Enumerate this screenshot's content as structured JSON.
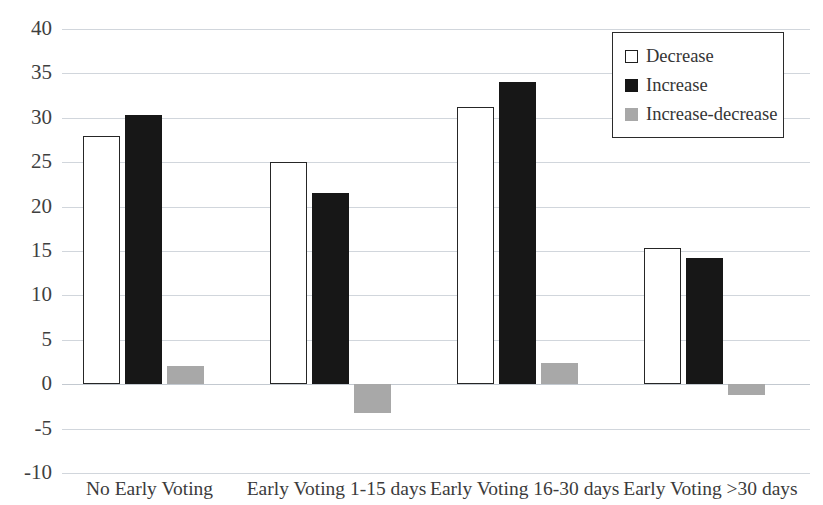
{
  "chart_data": {
    "type": "bar",
    "title": "",
    "subtitle": "",
    "xlabel": "",
    "ylabel": "",
    "ylim": [
      -10,
      40
    ],
    "ytick_step": 5,
    "yticks": [
      "40",
      "35",
      "30",
      "25",
      "20",
      "15",
      "10",
      "5",
      "0",
      "-5",
      "-10"
    ],
    "ytick_values": [
      40,
      35,
      30,
      25,
      20,
      15,
      10,
      5,
      0,
      -5,
      -10
    ],
    "grid": true,
    "grid_axis": "y",
    "legend_position": "top-right",
    "categories": [
      "No Early Voting",
      "Early Voting 1-15 days",
      "Early Voting 16-30 days",
      "Early Voting >30 days"
    ],
    "series": [
      {
        "name": "Decrease",
        "color": "#ffffff",
        "edge_color": "#262626",
        "values": [
          28.0,
          25.0,
          31.2,
          15.3
        ]
      },
      {
        "name": "Increase",
        "color": "#171717",
        "edge_color": "#171717",
        "values": [
          30.3,
          21.5,
          34.0,
          14.2
        ]
      },
      {
        "name": "Increase-decrease",
        "color": "#a8a8a8",
        "edge_color": "#a8a8a8",
        "values": [
          2.0,
          -3.2,
          2.4,
          -1.2
        ]
      }
    ]
  },
  "legend": {
    "items": [
      {
        "label": "Decrease",
        "swatch": "white-square-icon"
      },
      {
        "label": "Increase",
        "swatch": "black-square-icon"
      },
      {
        "label": "Increase-decrease",
        "swatch": "gray-square-icon"
      }
    ]
  },
  "axis": {
    "y_labels": [
      "40",
      "35",
      "30",
      "25",
      "20",
      "15",
      "10",
      "5",
      "0",
      "-5",
      "-10"
    ],
    "x_labels": [
      "No Early Voting",
      "Early Voting 1-15 days",
      "Early Voting 16-30 days",
      "Early Voting >30 days"
    ]
  },
  "colors": {
    "decrease": "#ffffff",
    "increase": "#171717",
    "increase_decrease": "#a8a8a8",
    "gridline": "#c9cfd6",
    "text": "#3b3b3b"
  }
}
